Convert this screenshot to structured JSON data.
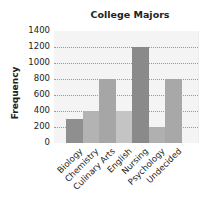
{
  "chart_data": {
    "type": "bar",
    "title": "College Majors",
    "xlabel": "",
    "ylabel": "Frequency",
    "categories": [
      "Biology",
      "Chemistry",
      "Culinary Arts",
      "English",
      "Nursing",
      "Psychology",
      "Undecided"
    ],
    "values": [
      300,
      400,
      800,
      400,
      1200,
      200,
      800
    ],
    "ylim": [
      0,
      1400
    ],
    "yticks": [
      "0",
      "200",
      "400",
      "600",
      "800",
      "1000",
      "1200",
      "1400"
    ],
    "grid": true,
    "legend": null,
    "bar_colors": [
      "#8f8f8f",
      "#b3b3b3",
      "#a6a6a6",
      "#c4c4c4",
      "#8a8a8a",
      "#b0b0b0",
      "#a8a8a8"
    ]
  }
}
